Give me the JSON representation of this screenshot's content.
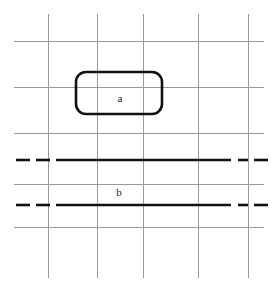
{
  "figure": {
    "title": "",
    "background_color": "#ffffff",
    "width": 277,
    "height": 292,
    "grid": {
      "line_color": "#9a9a9a",
      "line_width": 1,
      "vertical_lines": [
        {
          "x": 48,
          "y_start": 14,
          "y_end": 278
        },
        {
          "x": 97,
          "y_start": 14,
          "y_end": 278
        },
        {
          "x": 143,
          "y_start": 14,
          "y_end": 278
        },
        {
          "x": 198,
          "y_start": 14,
          "y_end": 278
        },
        {
          "x": 248,
          "y_start": 14,
          "y_end": 278
        }
      ],
      "horizontal_lines": [
        {
          "y": 41,
          "x_start": 14,
          "x_end": 264
        },
        {
          "y": 87,
          "x_start": 14,
          "x_end": 264
        },
        {
          "y": 133,
          "x_start": 14,
          "x_end": 264
        },
        {
          "y": 184,
          "x_start": 14,
          "x_end": 264
        },
        {
          "y": 227,
          "x_start": 14,
          "x_end": 264
        }
      ]
    },
    "shapes": {
      "rounded_rect": {
        "name": "rounded-rectangle-a",
        "x": 76,
        "y": 72,
        "width": 86,
        "height": 42,
        "corner_radius": 10,
        "stroke_color": "#111111",
        "stroke_width": 2.6,
        "fill": "none"
      },
      "thick_lines": [
        {
          "name": "upper-thick-line",
          "y": 160,
          "solid_x_start": 56,
          "solid_x_end": 231,
          "stroke_color": "#111111",
          "stroke_width": 2.6,
          "left_dashes": [
            {
              "x_start": 16,
              "x_end": 30
            },
            {
              "x_start": 36,
              "x_end": 50
            }
          ],
          "right_dashes": [
            {
              "x_start": 238,
              "x_end": 248
            },
            {
              "x_start": 254,
              "x_end": 268
            }
          ]
        },
        {
          "name": "lower-thick-line",
          "y": 205,
          "solid_x_start": 56,
          "solid_x_end": 231,
          "stroke_color": "#111111",
          "stroke_width": 2.6,
          "left_dashes": [
            {
              "x_start": 16,
              "x_end": 30
            },
            {
              "x_start": 36,
              "x_end": 50
            }
          ],
          "right_dashes": [
            {
              "x_start": 238,
              "x_end": 248
            },
            {
              "x_start": 254,
              "x_end": 268
            }
          ]
        }
      ]
    },
    "labels": [
      {
        "name": "label-a",
        "text": "a",
        "x": 120,
        "y": 102,
        "font_size": 11,
        "color": "#1a1a1a"
      },
      {
        "name": "label-b",
        "text": "b",
        "x": 119,
        "y": 196,
        "font_size": 11,
        "color": "#1a1a1a"
      }
    ]
  }
}
